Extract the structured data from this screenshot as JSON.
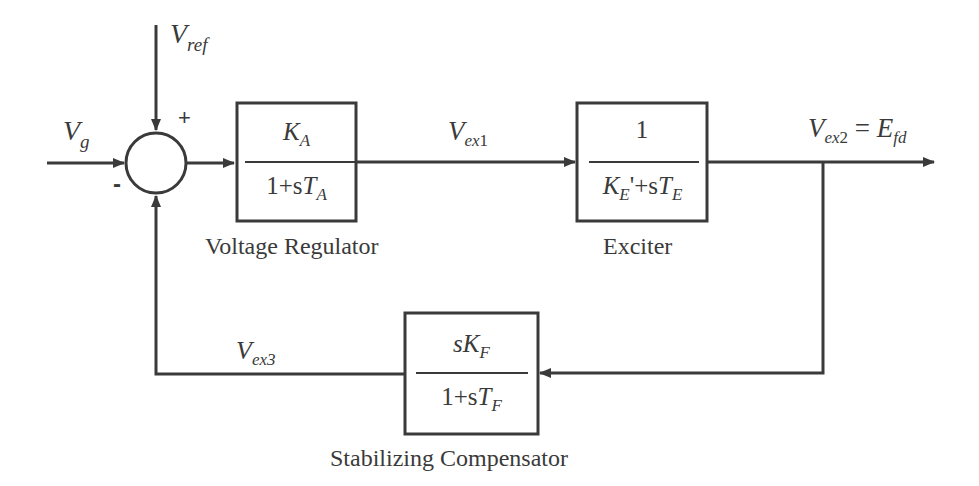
{
  "diagram": {
    "type": "block-diagram",
    "signals": {
      "vref": {
        "base": "V",
        "sub": "ref"
      },
      "vg": {
        "base": "V",
        "sub": "g"
      },
      "vex1": {
        "base": "V",
        "sub": "ex",
        "subnum": "1"
      },
      "vex2": {
        "base": "V",
        "sub": "ex",
        "subnum": "2",
        "eq": " = ",
        "rhs_base": "E",
        "rhs_sub": "fd"
      },
      "vex3": {
        "base": "V",
        "sub": "ex3"
      }
    },
    "summing_junction": {
      "plus_sign": "+",
      "minus_sign": "-"
    },
    "blocks": [
      {
        "id": "voltage-regulator",
        "caption": "Voltage Regulator",
        "numerator": {
          "K": "K",
          "K_sub": "A"
        },
        "denominator": {
          "prefix": "1+s",
          "T": "T",
          "T_sub": "A"
        }
      },
      {
        "id": "exciter",
        "caption": "Exciter",
        "numerator": {
          "text": "1"
        },
        "denominator": {
          "K": "K",
          "K_sub": "E",
          "prime": "'",
          "mid": "+s",
          "T": "T",
          "T_sub": "E"
        }
      },
      {
        "id": "stabilizing-compensator",
        "caption": "Stabilizing Compensator",
        "numerator": {
          "prefix": "s",
          "K": "K",
          "K_sub": "F"
        },
        "denominator": {
          "prefix": "1+s",
          "T": "T",
          "T_sub": "F"
        }
      }
    ],
    "colors": {
      "stroke": "#3a3a3a",
      "background": "#ffffff"
    }
  }
}
